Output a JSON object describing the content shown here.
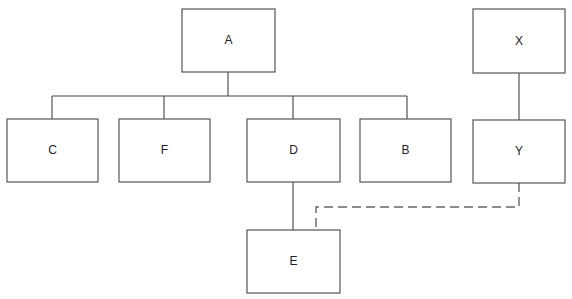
{
  "nodes": {
    "A": {
      "label": "A"
    },
    "C": {
      "label": "C"
    },
    "F": {
      "label": "F"
    },
    "D": {
      "label": "D"
    },
    "B": {
      "label": "B"
    },
    "E": {
      "label": "E"
    },
    "X": {
      "label": "X"
    },
    "Y": {
      "label": "Y"
    }
  },
  "edges": [
    {
      "from": "A",
      "to": "C",
      "style": "solid"
    },
    {
      "from": "A",
      "to": "F",
      "style": "solid"
    },
    {
      "from": "A",
      "to": "D",
      "style": "solid"
    },
    {
      "from": "A",
      "to": "B",
      "style": "solid"
    },
    {
      "from": "D",
      "to": "E",
      "style": "solid"
    },
    {
      "from": "X",
      "to": "Y",
      "style": "solid"
    },
    {
      "from": "Y",
      "to": "E",
      "style": "dashed"
    }
  ]
}
